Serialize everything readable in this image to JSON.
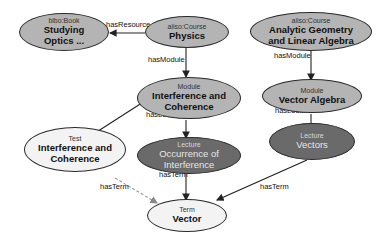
{
  "nodes": {
    "book": {
      "type": "bibo:Book",
      "name": "Studying Optics ..."
    },
    "physics": {
      "type": "aiiso:Course",
      "name": "Physics"
    },
    "geometry": {
      "type": "aiiso:Course",
      "name": "Analytic Geometry and Linear Algebra"
    },
    "module_ic": {
      "type": "Module",
      "name": "Interference and Coherence"
    },
    "module_va": {
      "type": "Module",
      "name": "Vector Algebra"
    },
    "test_ic": {
      "type": "Test",
      "name": "Interference and Coherence"
    },
    "lecture_oi": {
      "type": "Lecture",
      "name": "Occurrence of Interference"
    },
    "lecture_v": {
      "type": "Lecture",
      "name": "Vectors"
    },
    "term_v": {
      "type": "Term",
      "name": "Vector"
    }
  },
  "edges": {
    "has_resource": "hasResource",
    "physics_has_module": "hasModule",
    "geometry_has_module": "hasModule",
    "module_ic_has_lecture": "hasLecture",
    "module_va_has_lecture": "hasLecture",
    "test_has_term": "hasTerm",
    "lecture_oi_has_term": "hasTerm",
    "lecture_v_has_term": "hasTerm"
  },
  "colors": {
    "light_fill": "#f3f3f3",
    "mid_fill": "#b4b4b4",
    "dark_fill": "#6a6a6a",
    "stroke": "#2a2a2a",
    "dashed_edge": "#999999"
  }
}
